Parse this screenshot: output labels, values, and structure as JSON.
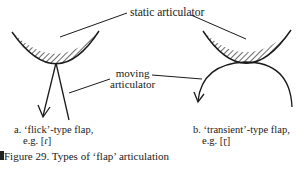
{
  "diagram": {
    "labels": {
      "static": "static articulator",
      "moving_line1": "moving",
      "moving_line2": "articulator"
    },
    "panels": [
      {
        "id": "a",
        "letter": "a.",
        "title": "‘flick’-type flap,",
        "example_prefix": "e.g.",
        "example_symbol": "[ɾ]"
      },
      {
        "id": "b",
        "letter": "b.",
        "title": "‘transient’-type flap,",
        "example_prefix": "e.g.",
        "example_symbol": "[ɽ]"
      }
    ],
    "caption": "Figure 29. Types of ‘flap’ articulation",
    "colors": {
      "ink": "#1a1a1a",
      "background": "#ffffff"
    }
  }
}
